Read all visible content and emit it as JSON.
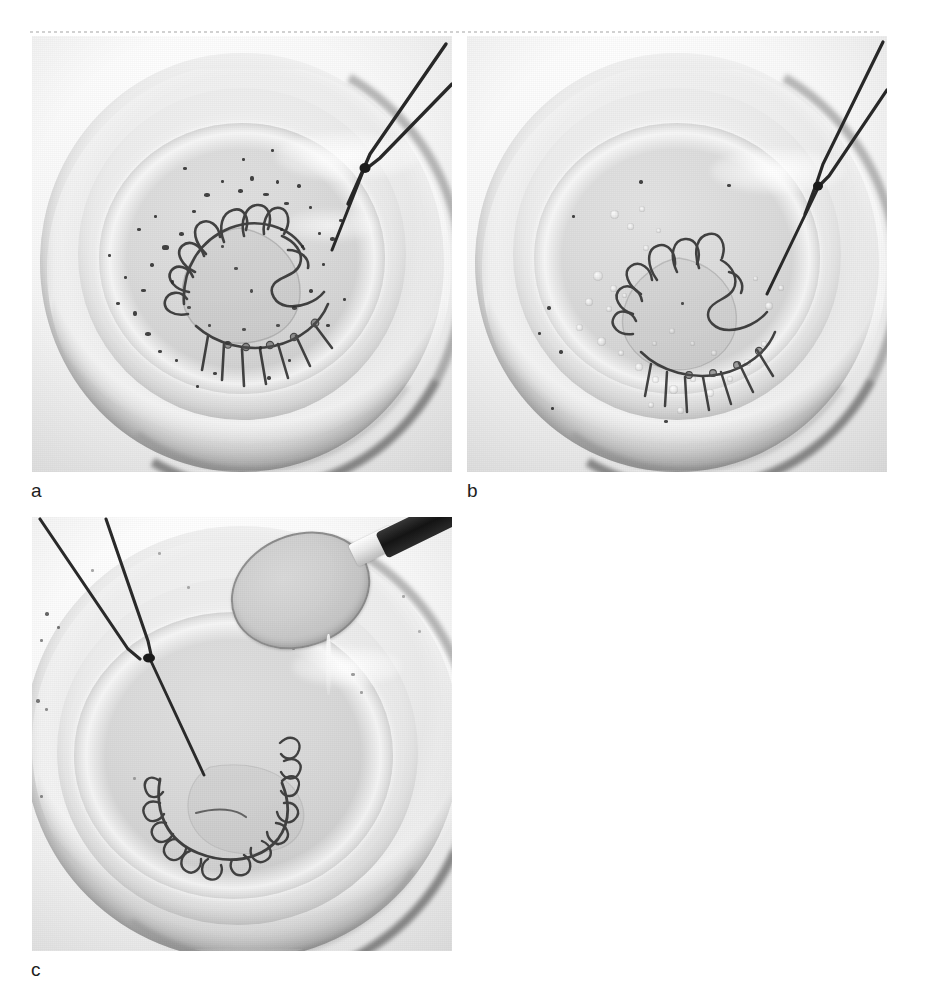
{
  "figure": {
    "type": "multi-panel-photograph",
    "background_color": "#ffffff",
    "width": 925,
    "height": 995,
    "scan_rule": {
      "style": "dashed",
      "color": "#c9c9c9"
    }
  },
  "panels": [
    {
      "id": "a",
      "label": "a",
      "x": 32,
      "y": 36,
      "width": 420,
      "height": 436,
      "subject": "orthodontic-retainer-in-bowl",
      "description": "Removable orthodontic retainer with labial bow and clasps lying in a shallow translucent bowl of cleaning solution, heavy dark debris scattered across the liquid surface; thin metal tweezers enter from the upper right holding the appliance.",
      "contents": {
        "vessel": "shallow translucent bowl",
        "liquid": "cleaning solution",
        "appliance": "orthodontic retainer wire framework",
        "instrument": "tweezers",
        "debris_visible": true,
        "foam_visible": false,
        "spoon_visible": false
      },
      "colors": {
        "background": "#f3f3f3",
        "bowl": "#ececec",
        "liquid": "#d9d9d9",
        "wire": "#2f2f2f",
        "debris": "#262626",
        "rim_shadow": "#4a4a4a"
      }
    },
    {
      "id": "b",
      "label": "b",
      "x": 467,
      "y": 36,
      "width": 420,
      "height": 436,
      "subject": "orthodontic-retainer-in-effervescing-solution",
      "description": "The same retainer in the bowl after the effervescent cleaning tablet has dissolved; the solution is cloudy with clusters of small bubbles and far less loose debris. Tweezers still enter from the upper right.",
      "contents": {
        "vessel": "shallow translucent bowl",
        "liquid": "effervescing cleaning solution",
        "appliance": "orthodontic retainer wire framework",
        "instrument": "tweezers",
        "debris_visible": false,
        "foam_visible": true,
        "spoon_visible": false
      },
      "colors": {
        "background": "#f3f3f3",
        "bowl": "#ededed",
        "liquid": "#dcdcdc",
        "wire": "#333333",
        "debris": "#2b2b2b",
        "rim_shadow": "#4a4a4a"
      }
    },
    {
      "id": "c",
      "label": "c",
      "x": 32,
      "y": 517,
      "width": 420,
      "height": 434,
      "subject": "retainer-rinse-with-spoon",
      "description": "The cleaned retainer resting at the bottom of the bowl, clasps clearly visible and free of deposits. A dark-handled spoon full of rinse liquid is held over the bowl at the upper right while tweezers descend from the upper left.",
      "contents": {
        "vessel": "shallow translucent bowl",
        "liquid": "clear rinse water",
        "appliance": "orthodontic retainer wire framework",
        "instrument": "tweezers",
        "debris_visible": false,
        "foam_visible": false,
        "spoon_visible": true
      },
      "colors": {
        "background": "#f4f4f4",
        "bowl": "#eeeeee",
        "liquid": "#dadada",
        "wire": "#2e2e2e",
        "spoon_handle": "#1a1a1a",
        "rim_shadow": "#3f3f3f"
      }
    }
  ]
}
